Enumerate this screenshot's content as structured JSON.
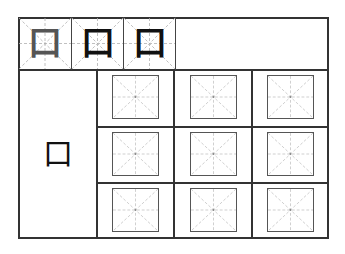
{
  "worksheet": {
    "trace_row": {
      "characters": [
        "口",
        "口",
        "口"
      ],
      "ink_colors": [
        "#555555",
        "#111111",
        "#111111"
      ]
    },
    "model_character": "口",
    "practice_grid": {
      "rows": 3,
      "cols": 3,
      "cell_style": "mi-zi-ge"
    },
    "colors": {
      "frame": "#333333",
      "guide": "#b0b0b0",
      "box": "#555555"
    }
  }
}
